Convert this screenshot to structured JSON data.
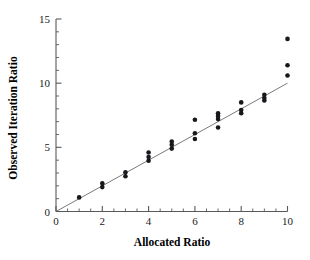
{
  "chart_data": {
    "type": "scatter",
    "title": "",
    "xlabel": "Allocated Ratio",
    "ylabel": "Observed Iteration Ratio",
    "xlim": [
      0,
      10
    ],
    "ylim": [
      0,
      15
    ],
    "xticks": [
      0,
      2,
      4,
      6,
      8,
      10
    ],
    "yticks": [
      0,
      5,
      10,
      15
    ],
    "xtick_labels": [
      "0",
      "2",
      "4",
      "6",
      "8",
      "10"
    ],
    "ytick_labels": [
      "0",
      "5",
      "10",
      "15"
    ],
    "x_minor_tick_step": 0.5,
    "y_minor_tick_step": 1,
    "grid": false,
    "legend": null,
    "marker": {
      "shape": "circle",
      "color": "#17171c",
      "size_px": 4.6
    },
    "reference_line": {
      "kind": "identity",
      "label": "y = x",
      "color": "#6b6b6b",
      "from": [
        0,
        0
      ],
      "to": [
        10,
        10
      ]
    },
    "series": [
      {
        "name": "Observed Iteration Ratio",
        "points": [
          [
            1,
            1.1
          ],
          [
            2,
            1.9
          ],
          [
            2,
            2.2
          ],
          [
            3,
            2.75
          ],
          [
            3,
            3.05
          ],
          [
            4,
            3.95
          ],
          [
            4,
            4.25
          ],
          [
            4,
            4.6
          ],
          [
            5,
            4.9
          ],
          [
            5,
            5.2
          ],
          [
            5,
            5.45
          ],
          [
            6,
            5.65
          ],
          [
            6,
            6.1
          ],
          [
            6,
            7.15
          ],
          [
            7,
            6.55
          ],
          [
            7,
            7.2
          ],
          [
            7,
            7.45
          ],
          [
            7,
            7.65
          ],
          [
            8,
            7.65
          ],
          [
            8,
            7.9
          ],
          [
            8,
            8.5
          ],
          [
            9,
            8.65
          ],
          [
            9,
            8.85
          ],
          [
            9,
            9.1
          ],
          [
            10,
            10.6
          ],
          [
            10,
            11.4
          ],
          [
            10,
            13.45
          ]
        ]
      }
    ]
  },
  "axes": {
    "x_title": "Allocated Ratio",
    "y_title": "Observed Iteration Ratio"
  }
}
